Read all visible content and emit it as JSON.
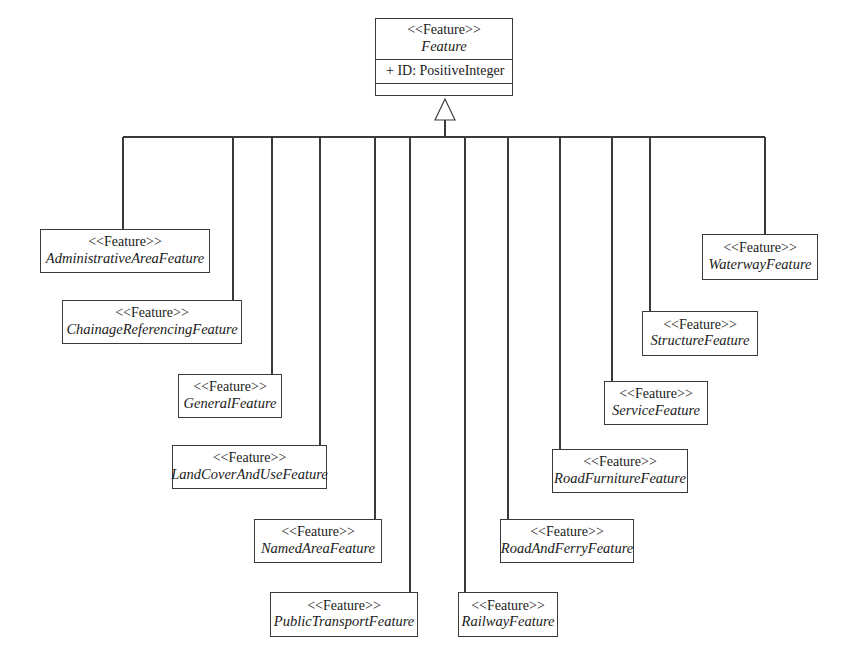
{
  "diagram": {
    "type": "uml-class-diagram",
    "relationship": "generalization",
    "colors": {
      "background": "#ffffff",
      "stroke": "#3a3a3a",
      "text": "#1a1a1a"
    },
    "root": {
      "stereotype": "<<Feature>>",
      "name": "Feature",
      "attributes": [
        "+ ID: PositiveInteger"
      ],
      "operations": [],
      "box": {
        "x": 375,
        "y": 18,
        "w": 138,
        "h": 78
      }
    },
    "subclasses": [
      {
        "stereotype": "<<Feature>>",
        "name": "AdministrativeAreaFeature",
        "box": {
          "x": 40,
          "y": 229,
          "w": 170,
          "h": 44
        },
        "connector_x": 123,
        "connect_side": "top"
      },
      {
        "stereotype": "<<Feature>>",
        "name": "ChainageReferencingFeature",
        "box": {
          "x": 62,
          "y": 300,
          "w": 180,
          "h": 44
        },
        "connector_x": 233,
        "connect_side": "top"
      },
      {
        "stereotype": "<<Feature>>",
        "name": "GeneralFeature",
        "box": {
          "x": 178,
          "y": 374,
          "w": 104,
          "h": 44
        },
        "connector_x": 272,
        "connect_side": "top"
      },
      {
        "stereotype": "<<Feature>>",
        "name": "LandCoverAndUseFeature",
        "box": {
          "x": 172,
          "y": 445,
          "w": 155,
          "h": 44
        },
        "connector_x": 320,
        "connect_side": "top"
      },
      {
        "stereotype": "<<Feature>>",
        "name": "NamedAreaFeature",
        "box": {
          "x": 254,
          "y": 519,
          "w": 128,
          "h": 44
        },
        "connector_x": 375,
        "connect_side": "top"
      },
      {
        "stereotype": "<<Feature>>",
        "name": "PublicTransportFeature",
        "box": {
          "x": 270,
          "y": 592,
          "w": 148,
          "h": 45
        },
        "connector_x": 410,
        "connect_side": "top"
      },
      {
        "stereotype": "<<Feature>>",
        "name": "RailwayFeature",
        "box": {
          "x": 458,
          "y": 592,
          "w": 100,
          "h": 45
        },
        "connector_x": 465,
        "connect_side": "top"
      },
      {
        "stereotype": "<<Feature>>",
        "name": "RoadAndFerryFeature",
        "box": {
          "x": 500,
          "y": 519,
          "w": 134,
          "h": 44
        },
        "connector_x": 508,
        "connect_side": "top"
      },
      {
        "stereotype": "<<Feature>>",
        "name": "RoadFurnitureFeature",
        "box": {
          "x": 552,
          "y": 449,
          "w": 136,
          "h": 44
        },
        "connector_x": 560,
        "connect_side": "top"
      },
      {
        "stereotype": "<<Feature>>",
        "name": "ServiceFeature",
        "box": {
          "x": 604,
          "y": 381,
          "w": 104,
          "h": 44
        },
        "connector_x": 612,
        "connect_side": "top"
      },
      {
        "stereotype": "<<Feature>>",
        "name": "StructureFeature",
        "box": {
          "x": 642,
          "y": 311,
          "w": 116,
          "h": 45
        },
        "connector_x": 650,
        "connect_side": "top"
      },
      {
        "stereotype": "<<Feature>>",
        "name": "WaterwayFeature",
        "box": {
          "x": 702,
          "y": 234,
          "w": 116,
          "h": 46
        },
        "connector_x": 765,
        "connect_side": "top"
      }
    ],
    "connector_bar": {
      "y": 137,
      "x_start": 123,
      "x_end": 765
    },
    "generalization_arrow": {
      "x": 445,
      "tip_y": 99,
      "base_y": 120,
      "half_width": 10,
      "stem_bottom_y": 137
    }
  }
}
